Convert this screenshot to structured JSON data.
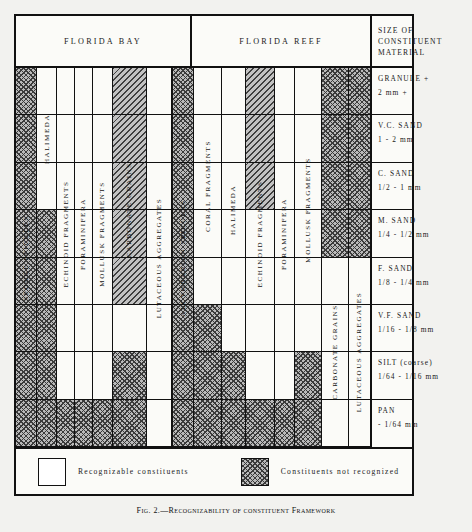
{
  "header": {
    "bay": "FLORIDA BAY",
    "reef": "FLORIDA REEF",
    "size": "SIZE OF CONSTITUENT MATERIAL"
  },
  "legend": {
    "recognizable": "Recognizable constituents",
    "not_recognized": "Constituents not recognized",
    "swatch_recognizable": "white",
    "swatch_not_recognized": "hatch"
  },
  "caption": "Fig. 2.—Recognizability of constituent Framework",
  "colors": {
    "ink": "#111111",
    "paper": "#fbfbf8",
    "page": "#f2f2ef",
    "hatch_fill": "#b9b9b9",
    "hatch_line": "#3a3a3a"
  },
  "chart_data": {
    "type": "heatmap",
    "xlabel": "Constituent",
    "ylabel": "Size of constituent material",
    "legend": [
      {
        "key": "recognizable",
        "label": "Recognizable constituents",
        "fill": "white"
      },
      {
        "key": "not_recognized",
        "label": "Constituents not recognized",
        "fill": "hatch"
      }
    ],
    "grid": true,
    "legend_position": "bottom",
    "rows": [
      {
        "name": "GRANULE +",
        "range": "2 mm +"
      },
      {
        "name": "V.C. SAND",
        "range": "1 - 2 mm"
      },
      {
        "name": "C. SAND",
        "range": "1/2 - 1 mm"
      },
      {
        "name": "M. SAND",
        "range": "1/4 - 1/2 mm"
      },
      {
        "name": "F. SAND",
        "range": "1/8 - 1/4 mm"
      },
      {
        "name": "V.F. SAND",
        "range": "1/16 - 1/8 mm"
      },
      {
        "name": "SILT (coarse)",
        "range": "1/64 - 1/16 mm"
      },
      {
        "name": "PAN",
        "range": "- 1/64 mm"
      }
    ],
    "groups": [
      {
        "name": "FLORIDA BAY",
        "columns": [
          {
            "label": "SPONGE SPICULES",
            "values": [
              "hatch",
              "hatch",
              "hatch",
              "hatch",
              "hatch",
              "hatch",
              "hatch",
              "hatch"
            ]
          },
          {
            "label": "HALIMEDA",
            "values": [
              "plain",
              "plain",
              "plain",
              "hatch",
              "hatch",
              "hatch",
              "hatch",
              "hatch"
            ]
          },
          {
            "label": "ECHINOID FRAGMENTS",
            "values": [
              "plain",
              "plain",
              "plain",
              "plain",
              "plain",
              "plain",
              "plain",
              "hatch"
            ]
          },
          {
            "label": "FORAMINIFERA",
            "values": [
              "plain",
              "plain",
              "plain",
              "plain",
              "plain",
              "plain",
              "plain",
              "hatch"
            ]
          },
          {
            "label": "MOLLUSK FRAGMENTS",
            "values": [
              "plain",
              "plain",
              "plain",
              "plain",
              "plain",
              "plain",
              "plain",
              "hatch"
            ]
          },
          {
            "label": "CARBONATE GRAINS",
            "values": [
              "diag",
              "diag",
              "diag",
              "diag",
              "diag",
              "plain",
              "hatch",
              "hatch"
            ]
          },
          {
            "label": "LUTACEOUS AGGREGATES",
            "values": [
              "plain",
              "plain",
              "plain",
              "plain",
              "plain",
              "plain",
              "plain",
              "plain"
            ]
          }
        ]
      },
      {
        "name": "FLORIDA REEF",
        "columns": [
          {
            "label": "ALCYONARIAN SPICULES",
            "values": [
              "hatch",
              "hatch",
              "hatch",
              "hatch",
              "hatch",
              "hatch",
              "hatch",
              "hatch"
            ]
          },
          {
            "label": "CORAL FRAGMENTS",
            "values": [
              "plain",
              "plain",
              "plain",
              "plain",
              "plain",
              "hatch",
              "hatch",
              "hatch"
            ]
          },
          {
            "label": "HALIMEDA",
            "values": [
              "plain",
              "plain",
              "plain",
              "plain",
              "plain",
              "plain",
              "hatch",
              "hatch"
            ]
          },
          {
            "label": "ECHINOID FRAGMENTS",
            "values": [
              "diag",
              "diag",
              "diag",
              "plain",
              "plain",
              "plain",
              "plain",
              "hatch"
            ]
          },
          {
            "label": "FORAMINIFERA",
            "values": [
              "plain",
              "plain",
              "plain",
              "plain",
              "plain",
              "plain",
              "plain",
              "hatch"
            ]
          },
          {
            "label": "MOLLUSK FRAGMENTS",
            "values": [
              "plain",
              "plain",
              "plain",
              "plain",
              "plain",
              "plain",
              "hatch",
              "hatch"
            ]
          },
          {
            "label": "CARBONATE GRAINS",
            "values": [
              "hatch",
              "hatch",
              "hatch",
              "hatch",
              "plain",
              "plain",
              "plain",
              "plain"
            ]
          },
          {
            "label": "LUTACEOUS AGGREGATES",
            "values": [
              "hatch",
              "hatch",
              "hatch",
              "hatch",
              "plain",
              "plain",
              "plain",
              "plain"
            ]
          }
        ]
      }
    ]
  }
}
